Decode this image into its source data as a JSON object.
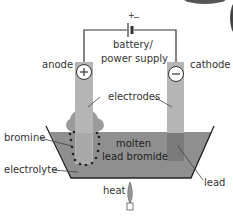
{
  "diagram": {
    "labels": {
      "battery_line1": "battery/",
      "battery_line2": "power supply",
      "battery_polarity_plus": "+",
      "battery_polarity_minus": "−",
      "anode": "anode",
      "cathode": "cathode",
      "anode_sign": "+",
      "cathode_sign": "−",
      "electrodes": "electrodes",
      "bromine": "bromine",
      "molten_line1": "molten",
      "molten_line2": "lead bromide",
      "electrolyte": "electrolyte",
      "lead": "lead",
      "heat": "heat"
    },
    "colors": {
      "electrolyte": "#8f8f8f",
      "electrode": "#b5b5b5",
      "lead_deposit": "#7a7a7a",
      "bromine_gas": "#8a8a8a",
      "wire": "#333333",
      "flame": "#999999"
    }
  }
}
